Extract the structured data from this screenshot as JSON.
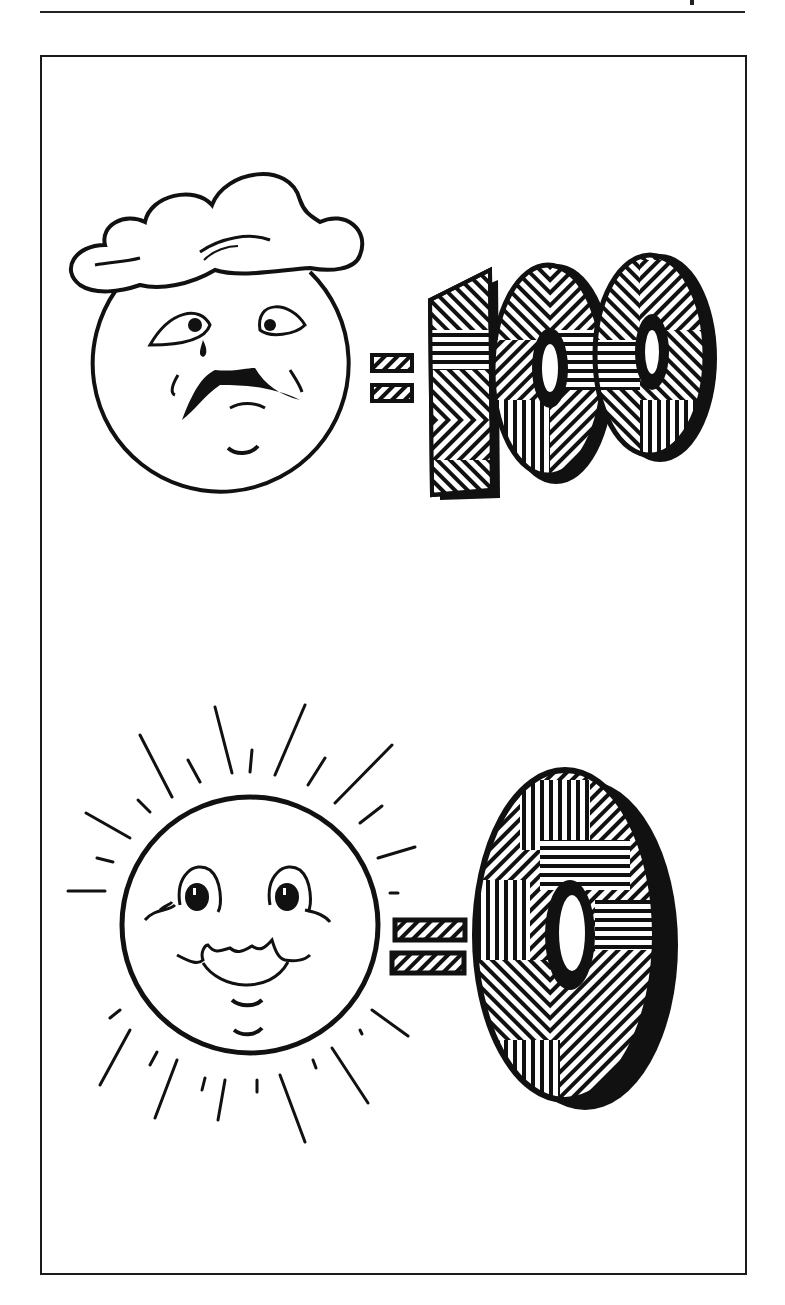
{
  "page": {
    "header_text": "",
    "frame": {
      "stroke": "#1a1a1a",
      "background": "#ffffff"
    }
  },
  "illustration": {
    "top_panel": {
      "figure": "sad sun face under a cloud",
      "operator": "=",
      "value": "100"
    },
    "bottom_panel": {
      "figure": "happy smiling sun with rays",
      "operator": "=",
      "value": "0"
    }
  },
  "colors": {
    "ink": "#111111",
    "paper": "#ffffff"
  }
}
